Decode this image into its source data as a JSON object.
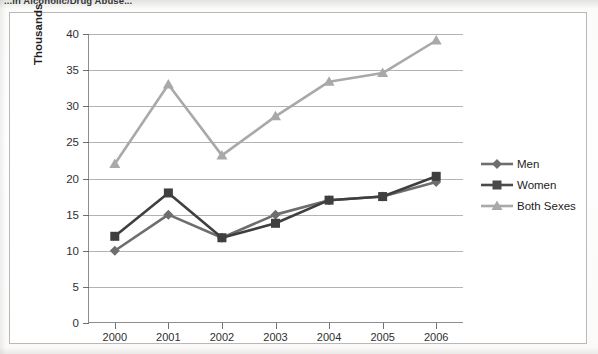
{
  "title": "...in Alcoholic/Drug Abuse...",
  "axes": {
    "y_title": "Thousands",
    "y_ticks": [
      0,
      5,
      10,
      15,
      20,
      25,
      30,
      35,
      40
    ],
    "x_ticks": [
      "2000",
      "2001",
      "2002",
      "2003",
      "2004",
      "2005",
      "2006"
    ]
  },
  "legend": {
    "position": "right",
    "items": [
      {
        "label": "Men",
        "color": "#6e6e6e",
        "marker": "diamond"
      },
      {
        "label": "Women",
        "color": "#4a4a4a",
        "marker": "square"
      },
      {
        "label": "Both Sexes",
        "color": "#a9a9a9",
        "marker": "triangle"
      }
    ]
  },
  "colors": {
    "men": "#6e6e6e",
    "women": "#3f3f3f",
    "both": "#a9a9a9",
    "grid": "#9a9a9a",
    "axis": "#8d8d8d",
    "frame": "#b9b9b9",
    "text": "#2f2f2f"
  },
  "chart_data": {
    "type": "line",
    "title": "...in Alcoholic/Drug Abuse...",
    "xlabel": "",
    "ylabel": "Thousands",
    "ylim": [
      0,
      40
    ],
    "ytick_step": 5,
    "grid": true,
    "legend_position": "right",
    "categories": [
      "2000",
      "2001",
      "2002",
      "2003",
      "2004",
      "2005",
      "2006"
    ],
    "series": [
      {
        "name": "Men",
        "values": [
          10.0,
          15.0,
          11.8,
          15.0,
          17.0,
          17.5,
          19.5
        ],
        "color": "#6e6e6e",
        "marker": "diamond"
      },
      {
        "name": "Women",
        "values": [
          12.0,
          18.0,
          11.8,
          13.8,
          17.0,
          17.5,
          20.3
        ],
        "color": "#3f3f3f",
        "marker": "square"
      },
      {
        "name": "Both Sexes",
        "values": [
          22.0,
          33.0,
          23.2,
          28.6,
          33.4,
          34.6,
          39.1
        ],
        "color": "#a9a9a9",
        "marker": "triangle"
      }
    ]
  }
}
